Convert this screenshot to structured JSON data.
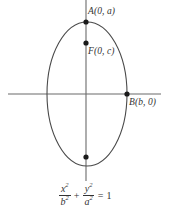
{
  "figure": {
    "stroke_color": "#4a4a4a",
    "axis_color": "#6b6b6b",
    "point_color": "#1a1a1a",
    "background_color": "#ffffff"
  },
  "axes": {
    "x_axis": {
      "name": "x-axis",
      "y": 94,
      "x_start": 8,
      "x_end": 161
    },
    "y_axis": {
      "name": "y-axis",
      "x": 86,
      "y_start": 0,
      "y_end": 181
    }
  },
  "ellipse": {
    "center_x": 87,
    "center_y": 94,
    "semi_minor_b": 40,
    "semi_major_a": 72
  },
  "points": [
    {
      "id": "A",
      "label": "A(0, a)",
      "x": 86,
      "y": 22,
      "role": "vertex-top"
    },
    {
      "id": "F",
      "label": "F(0, c)",
      "x": 86,
      "y": 43,
      "role": "focus-upper"
    },
    {
      "id": "B",
      "label": "B(b, 0)",
      "x": 127,
      "y": 94,
      "role": "co-vertex-right"
    },
    {
      "id": "F2",
      "label": "",
      "x": 86,
      "y": 157,
      "role": "focus-lower"
    }
  ],
  "equation": {
    "full": "x^2/b^2 + y^2/a^2 = 1",
    "num1": "x",
    "num1_exp": "2",
    "den1": "b",
    "den1_exp": "2",
    "operator": "+",
    "num2": "y",
    "num2_exp": "2",
    "den2": "a",
    "den2_exp": "2",
    "equals": "=",
    "rhs": "1"
  }
}
